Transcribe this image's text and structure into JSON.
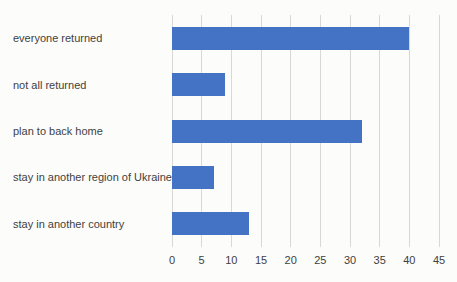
{
  "chart_data": {
    "type": "bar",
    "orientation": "horizontal",
    "title": "",
    "xlabel": "",
    "ylabel": "",
    "categories": [
      "everyone returned",
      "not all returned",
      "plan to back home",
      "stay in another region of Ukraine",
      "stay in another country"
    ],
    "values": [
      40,
      9,
      32,
      7,
      13
    ],
    "xlim": [
      0,
      45
    ],
    "x_ticks": [
      0,
      5,
      10,
      15,
      20,
      25,
      30,
      35,
      40,
      45
    ],
    "grid": "vertical-only",
    "legend_position": "none",
    "bar_color": "#4472C4",
    "gridline_color": "#d8d8d6",
    "text_color": "#3f3f3f",
    "background_color": "#fcfcfa"
  }
}
